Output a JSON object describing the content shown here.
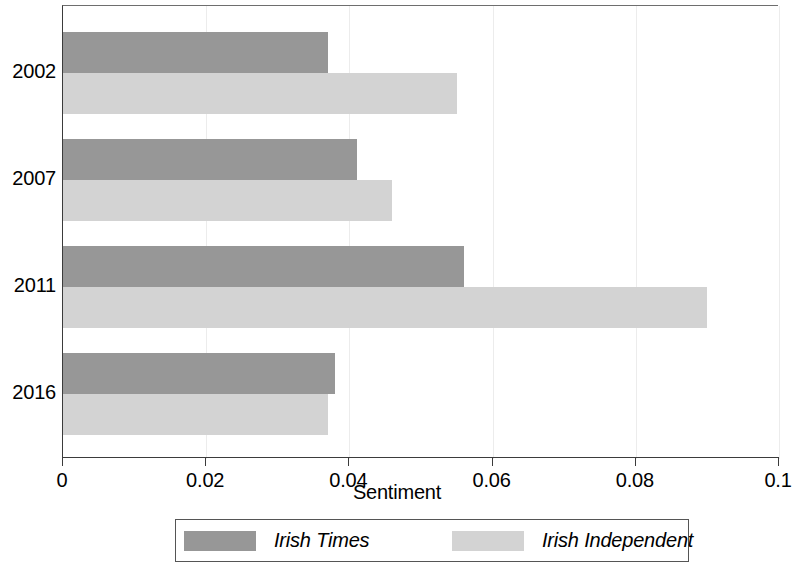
{
  "chart_data": {
    "type": "bar",
    "orientation": "horizontal",
    "title": "",
    "xlabel": "Sentiment",
    "ylabel": "",
    "xlim": [
      0,
      0.1
    ],
    "xticks": [
      "0",
      "0.02",
      "0.04",
      "0.06",
      "0.08",
      "0.1"
    ],
    "xtick_values": [
      0,
      0.02,
      0.04,
      0.06,
      0.08,
      0.1
    ],
    "grid": true,
    "categories": [
      "2002",
      "2007",
      "2011",
      "2016"
    ],
    "series": [
      {
        "name": "Irish Times",
        "color": "#979797",
        "values": [
          0.037,
          0.041,
          0.056,
          0.038
        ]
      },
      {
        "name": "Irish Independent",
        "color": "#d3d3d3",
        "values": [
          0.055,
          0.046,
          0.09,
          0.037
        ]
      }
    ],
    "legend": {
      "position": "bottom",
      "entries": [
        "Irish Times",
        "Irish Independent"
      ]
    }
  }
}
